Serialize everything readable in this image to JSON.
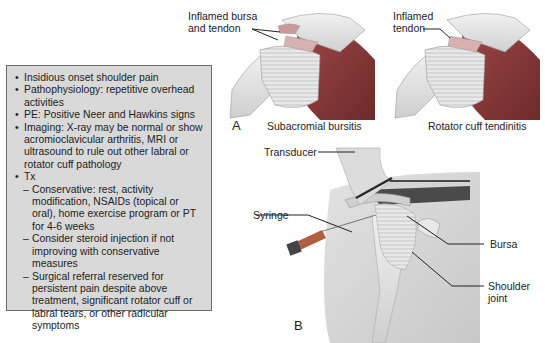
{
  "summary_box": {
    "items": [
      {
        "type": "bullet",
        "text": "Insidious onset shoulder pain"
      },
      {
        "type": "bullet",
        "text": "Pathophysiology: repetitive overhead activities"
      },
      {
        "type": "bullet",
        "text": "PE: Positive Neer and Hawkins signs"
      },
      {
        "type": "bullet",
        "text": "Imaging: X-ray may be normal or show acromioclavicular arthritis, MRI or ultrasound to rule out other labral or rotator cuff pathology"
      },
      {
        "type": "bullet",
        "text": "Tx"
      },
      {
        "type": "dash",
        "text": "Conservative: rest, activity modification, NSAIDs (topical or oral), home exercise program or PT for 4-6 weeks"
      },
      {
        "type": "dash",
        "text": "Consider steroid injection if not improving with conservative measures"
      },
      {
        "type": "dash",
        "text": "Surgical referral reserved for persistent pain despite above treatment, significant rotator cuff or labral tears, or other radicular symptoms"
      }
    ]
  },
  "panel_a": {
    "letter": "A",
    "left": {
      "label_line1": "Inflamed bursa",
      "label_line2": "and tendon",
      "caption": "Subacromial bursitis"
    },
    "right": {
      "label_line1": "Inflamed",
      "label_line2": "tendon",
      "caption": "Rotator cuff tendinitis"
    }
  },
  "panel_b": {
    "letter": "B",
    "labels": {
      "transducer": "Transducer",
      "syringe": "Syringe",
      "bursa": "Bursa",
      "shoulder_line1": "Shoulder",
      "shoulder_line2": "joint"
    }
  },
  "colors": {
    "box_bg": "#d9d9d9",
    "box_border": "#6a6a6a",
    "muscle": "#8a3a3a",
    "bone": "#e6e6e6"
  }
}
